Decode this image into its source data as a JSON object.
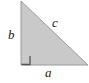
{
  "figure": {
    "name": "right-triangle-diagram",
    "background_color": "#ffffff",
    "fill_color": "#c9c9c9",
    "stroke_color": "#9a9a9a",
    "label_color": "#1a1a1a",
    "right_angle_marker_color": "#555555",
    "geometry": {
      "top_vertex": [
        21,
        1
      ],
      "bottom_left_vertex": [
        21,
        65
      ],
      "bottom_right_vertex": [
        88,
        65
      ],
      "right_angle_at": "bottom-left",
      "right_angle_marker_size": 9
    },
    "labels": {
      "leg_vertical": "b",
      "hypotenuse": "c",
      "leg_horizontal": "a"
    }
  }
}
